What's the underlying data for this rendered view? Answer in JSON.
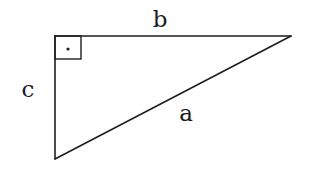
{
  "diagram": {
    "title": "",
    "type": "right-triangle",
    "colors": {
      "line": "#1e1e1e",
      "text": "#1a1a1a",
      "background": "#ffffff"
    },
    "vertices": {
      "right_angle": {
        "x": 55,
        "y": 36
      },
      "top_right": {
        "x": 291,
        "y": 36
      },
      "bottom_left": {
        "x": 55,
        "y": 159
      }
    },
    "right_angle_marker": {
      "x": 55,
      "y": 36,
      "size": 26,
      "dot": {
        "x": 68,
        "y": 49,
        "r": 1.6
      }
    },
    "labels": {
      "b": {
        "text": "b",
        "side": "top leg",
        "x": 160,
        "y": 27
      },
      "c": {
        "text": "c",
        "side": "left leg",
        "x": 28,
        "y": 97
      },
      "a": {
        "text": "a",
        "side": "hypotenuse",
        "x": 186,
        "y": 121
      }
    }
  }
}
